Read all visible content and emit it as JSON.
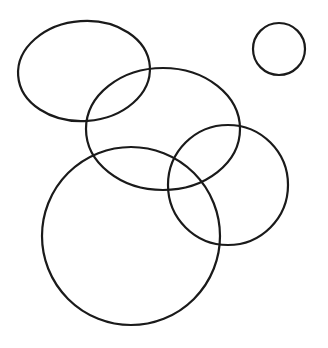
{
  "figure": {
    "background_color": "#ffffff",
    "stroke_color": "#1a1a1a",
    "stroke_width": 2.2,
    "canvas": {
      "width": 328,
      "height": 348
    },
    "shape_count": 5,
    "shape_count_label": "5"
  },
  "chart_data": {
    "type": "scatter",
    "xlabel": "",
    "ylabel": "",
    "xlim": [
      0,
      328
    ],
    "ylim": [
      0,
      348
    ],
    "grid": false,
    "legend": "none",
    "shapes": [
      {
        "name": "top-left-ellipse",
        "kind": "ellipse",
        "cx": 84,
        "cy": 71,
        "rx": 66,
        "ry": 50,
        "rotation": -4,
        "stroke": "#1a1a1a",
        "fill": "none"
      },
      {
        "name": "top-right-small-circle",
        "kind": "circle",
        "cx": 279,
        "cy": 49,
        "rx": 26,
        "ry": 26,
        "rotation": 0,
        "stroke": "#1a1a1a",
        "fill": "none"
      },
      {
        "name": "middle-ellipse",
        "kind": "ellipse",
        "cx": 163,
        "cy": 129,
        "rx": 77,
        "ry": 61,
        "rotation": 0,
        "stroke": "#1a1a1a",
        "fill": "none"
      },
      {
        "name": "right-circle",
        "kind": "circle",
        "cx": 228,
        "cy": 185,
        "rx": 60,
        "ry": 60,
        "rotation": 0,
        "stroke": "#1a1a1a",
        "fill": "none"
      },
      {
        "name": "large-bottom-left-circle",
        "kind": "circle",
        "cx": 131,
        "cy": 236,
        "rx": 89,
        "ry": 89,
        "rotation": 0,
        "stroke": "#1a1a1a",
        "fill": "none"
      }
    ]
  }
}
